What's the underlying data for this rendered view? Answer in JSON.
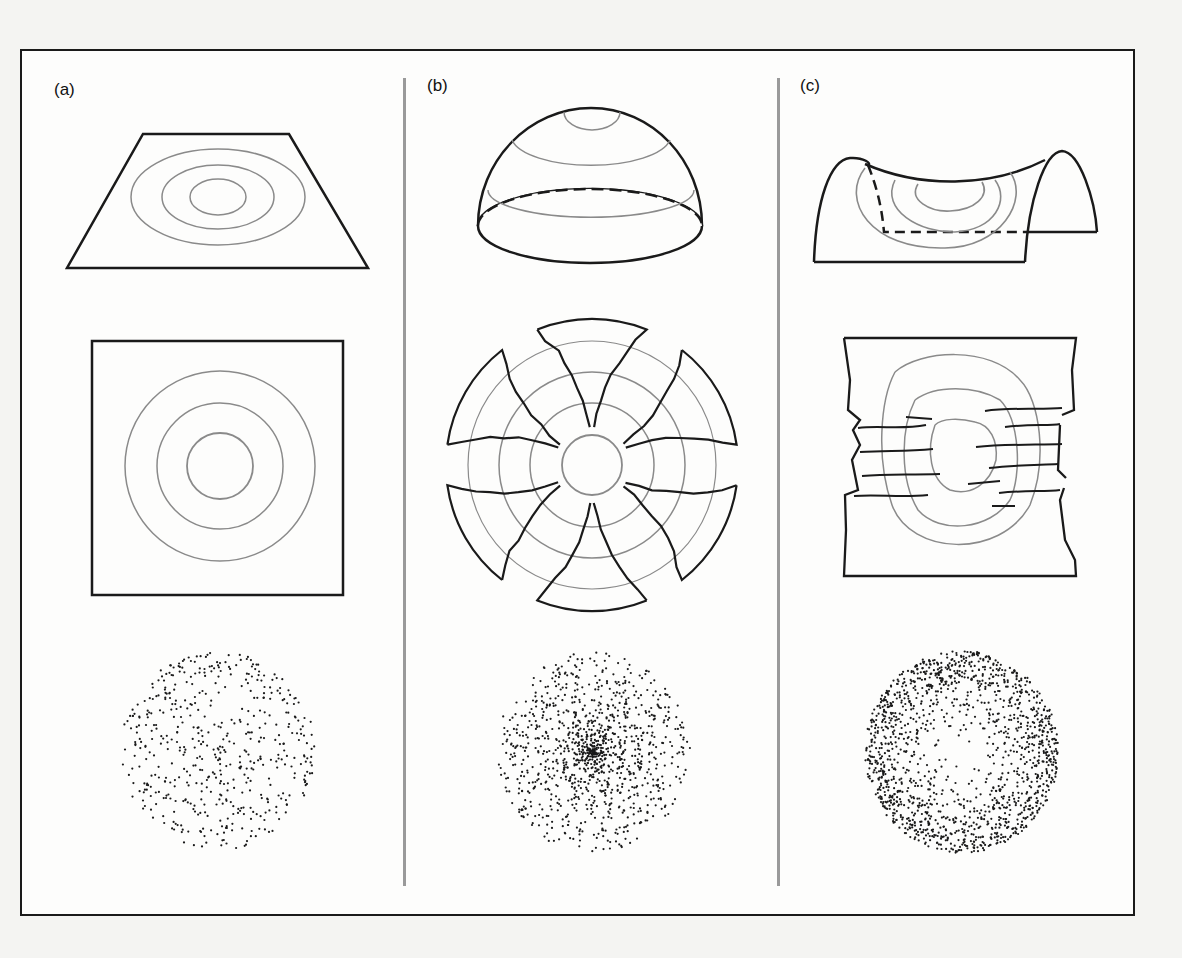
{
  "figure": {
    "panels": [
      {
        "id": "a",
        "label": "(a)",
        "surface": "flat",
        "contour_view": "concentric circles",
        "distribution": "uniform dots"
      },
      {
        "id": "b",
        "label": "(b)",
        "surface": "dome (positive curvature)",
        "contour_view": "flattened with radial tears",
        "distribution": "dots concentrated at center"
      },
      {
        "id": "c",
        "label": "(c)",
        "surface": "saddle (negative curvature)",
        "contour_view": "flattened with folds/overlaps",
        "distribution": "dots concentrated at rim"
      }
    ],
    "colors": {
      "outline": "#1a1a1a",
      "contour": "#8a8a8a",
      "divider": "#9a9a9a",
      "background": "#fdfdfc"
    }
  }
}
